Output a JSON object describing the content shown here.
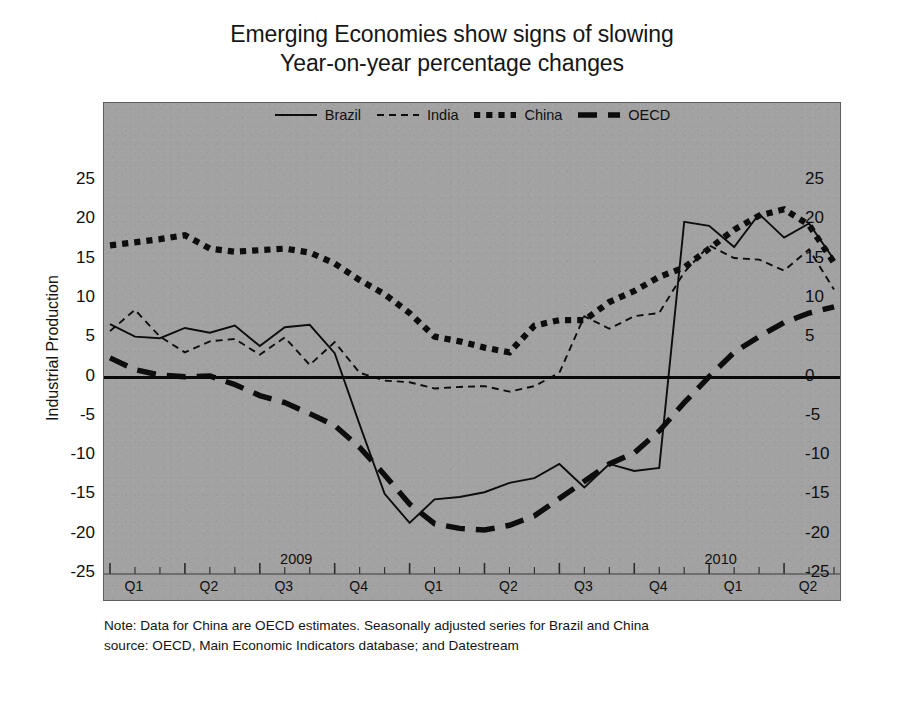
{
  "title": {
    "line1": "Emerging Economies show signs of slowing",
    "line2": "Year-on-year percentage changes"
  },
  "axis": {
    "ylabel": "Industrial Production",
    "yticks": [
      25,
      20,
      15,
      10,
      5,
      0,
      -5,
      -10,
      -15,
      -20,
      -25
    ],
    "quarter_labels": [
      "Q1",
      "Q2",
      "Q3",
      "Q4",
      "Q1",
      "Q2",
      "Q3",
      "Q4",
      "Q1",
      "Q2"
    ],
    "year_labels": [
      "2009",
      "2010"
    ]
  },
  "legend": [
    {
      "label": "Brazil",
      "style": "solid-thin",
      "color": "#0d0d0d"
    },
    {
      "label": "India",
      "style": "dashed-thin",
      "color": "#0d0d0d"
    },
    {
      "label": "China",
      "style": "dotted-thick",
      "color": "#0a0a0a"
    },
    {
      "label": "OECD",
      "style": "longdash-thick",
      "color": "#0a0a0a"
    }
  ],
  "note": {
    "line1": "Note: Data for China are OECD estimates. Seasonally adjusted series for Brazil and China",
    "line2": "source: OECD, Main Economic Indicators database; and  Datestream"
  },
  "colors": {
    "panel_background": "#a2a2a2",
    "panel_border": "#5d5d5d",
    "series_ink": "#0d0d0d",
    "page_background": "#ffffff"
  },
  "chart_data": {
    "type": "line",
    "xlabel": "",
    "ylabel": "Industrial Production",
    "ylim": [
      -25,
      25
    ],
    "ytick_step": 5,
    "grid": false,
    "legend_position": "top-center",
    "zero_line": true,
    "x_unit": "month",
    "x_start": "2008-Q1",
    "x_end": "2010-Q2",
    "x_quarters": [
      "2008 Q1",
      "2008 Q2",
      "2008 Q3",
      "2008 Q4",
      "2009 Q1",
      "2009 Q2",
      "2009 Q3",
      "2009 Q4",
      "2010 Q1",
      "2010 Q2"
    ],
    "x": [
      "2008-01",
      "2008-02",
      "2008-03",
      "2008-04",
      "2008-05",
      "2008-06",
      "2008-07",
      "2008-08",
      "2008-09",
      "2008-10",
      "2008-11",
      "2008-12",
      "2009-01",
      "2009-02",
      "2009-03",
      "2009-04",
      "2009-05",
      "2009-06",
      "2009-07",
      "2009-08",
      "2009-09",
      "2009-10",
      "2009-11",
      "2009-12",
      "2010-01",
      "2010-02",
      "2010-03",
      "2010-04",
      "2010-05",
      "2010-06"
    ],
    "series": [
      {
        "name": "Brazil",
        "style": "solid-thin",
        "values": [
          6.8,
          5.2,
          5.0,
          6.3,
          5.7,
          6.6,
          4.0,
          6.4,
          6.7,
          3.1,
          -6.0,
          -14.8,
          -18.5,
          -15.5,
          -15.2,
          -14.6,
          -13.4,
          -12.8,
          -11.0,
          -14.0,
          -11.0,
          -11.9,
          -11.5,
          19.8,
          19.3,
          16.6,
          20.8,
          17.8,
          19.6,
          15.0
        ]
      },
      {
        "name": "India",
        "style": "dashed-thin",
        "values": [
          5.9,
          8.6,
          5.2,
          3.2,
          4.6,
          4.9,
          2.9,
          5.1,
          1.6,
          4.5,
          0.6,
          -0.4,
          -0.6,
          -1.4,
          -1.2,
          -1.1,
          -1.8,
          -1.1,
          0.6,
          7.8,
          6.2,
          7.8,
          8.2,
          13.4,
          16.8,
          15.2,
          15.0,
          13.6,
          16.3,
          11.2
        ]
      },
      {
        "name": "China",
        "style": "dotted-thick",
        "values": [
          16.8,
          17.2,
          17.6,
          18.1,
          16.4,
          16.0,
          16.2,
          16.4,
          15.9,
          14.5,
          12.4,
          10.6,
          8.2,
          5.2,
          4.6,
          3.8,
          3.2,
          6.6,
          7.3,
          7.3,
          9.6,
          11.0,
          12.8,
          14.0,
          16.4,
          18.8,
          20.6,
          21.4,
          19.4,
          14.6
        ]
      },
      {
        "name": "OECD",
        "style": "longdash-thick",
        "values": [
          2.5,
          1.0,
          0.3,
          0.1,
          0.2,
          -0.9,
          -2.3,
          -3.2,
          -4.6,
          -6.1,
          -8.9,
          -12.4,
          -16.1,
          -18.6,
          -19.2,
          -19.4,
          -18.8,
          -17.6,
          -15.4,
          -13.2,
          -11.0,
          -9.6,
          -6.8,
          -3.2,
          0.1,
          3.2,
          5.2,
          7.0,
          8.2,
          9.0
        ]
      }
    ]
  }
}
